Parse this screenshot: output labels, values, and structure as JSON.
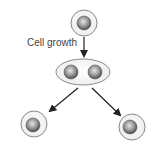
{
  "diagram": {
    "label": "Cell growth",
    "colors": {
      "cell_fill": "#f4f4f4",
      "cell_stroke": "#8a8a8a",
      "nucleus_light": "#d8d8d8",
      "nucleus_dark": "#555555",
      "arrow": "#222222",
      "text": "#444444"
    },
    "nodes": [
      {
        "id": "parent-cell",
        "type": "cell",
        "nuclei": 1
      },
      {
        "id": "dividing-cell",
        "type": "elongated-cell",
        "nuclei": 2
      },
      {
        "id": "daughter-cell-left",
        "type": "cell",
        "nuclei": 1
      },
      {
        "id": "daughter-cell-right",
        "type": "cell",
        "nuclei": 1
      }
    ],
    "edges": [
      {
        "from": "parent-cell",
        "to": "dividing-cell",
        "label": "Cell growth"
      },
      {
        "from": "dividing-cell",
        "to": "daughter-cell-left"
      },
      {
        "from": "dividing-cell",
        "to": "daughter-cell-right"
      }
    ]
  }
}
